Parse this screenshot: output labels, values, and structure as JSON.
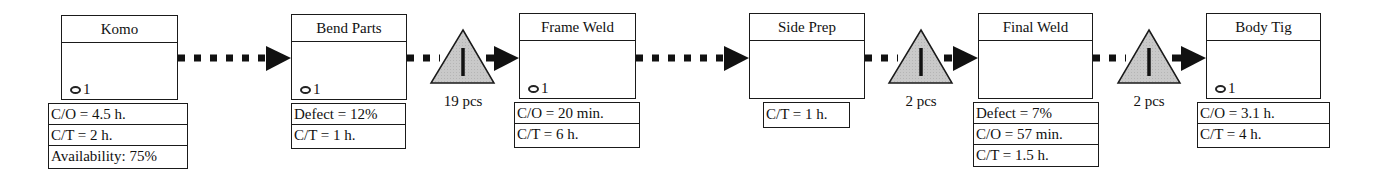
{
  "diagram": {
    "type": "value-stream-map",
    "colors": {
      "stroke": "#1a1a1a",
      "inventory_fill": "#c8c8c8",
      "background": "#ffffff"
    },
    "processes": [
      {
        "title": "Komo",
        "operator_icon": "operator-icon",
        "operators": "1",
        "data": [
          "C/O = 4.5 h.",
          "C/T = 2 h.",
          "Availability: 75%"
        ]
      },
      {
        "title": "Bend Parts",
        "operator_icon": "operator-icon",
        "operators": "1",
        "data": [
          "Defect = 12%",
          "C/T = 1 h."
        ]
      },
      {
        "title": "Frame Weld",
        "operator_icon": "operator-icon",
        "operators": "1",
        "data": [
          "C/O = 20 min.",
          "C/T = 6 h."
        ]
      },
      {
        "title": "Side Prep",
        "operators": null,
        "data": [
          "C/T = 1 h."
        ]
      },
      {
        "title": "Final Weld",
        "operators": null,
        "data": [
          "Defect = 7%",
          "C/O = 57 min.",
          "C/T = 1.5 h."
        ]
      },
      {
        "title": "Body Tig",
        "operator_icon": "operator-icon",
        "operators": "1",
        "data": [
          "C/O = 3.1 h.",
          "C/T = 4 h."
        ]
      }
    ],
    "inventories": [
      {
        "between": [
          "Bend Parts",
          "Frame Weld"
        ],
        "icon": "inventory-triangle-icon",
        "label": "19 pcs"
      },
      {
        "between": [
          "Side Prep",
          "Final Weld"
        ],
        "icon": "inventory-triangle-icon",
        "label": "2 pcs"
      },
      {
        "between": [
          "Final Weld",
          "Body Tig"
        ],
        "icon": "inventory-triangle-icon",
        "label": "2 pcs"
      }
    ],
    "connectors": [
      {
        "from": "Komo",
        "to": "Bend Parts",
        "style": "push-arrow-dotted"
      },
      {
        "from": "Bend Parts",
        "to": "Frame Weld",
        "style": "push-arrow-dotted"
      },
      {
        "from": "Frame Weld",
        "to": "Side Prep",
        "style": "push-arrow-dotted"
      },
      {
        "from": "Side Prep",
        "to": "Final Weld",
        "style": "push-arrow-dotted"
      },
      {
        "from": "Final Weld",
        "to": "Body Tig",
        "style": "push-arrow-dotted"
      }
    ]
  }
}
